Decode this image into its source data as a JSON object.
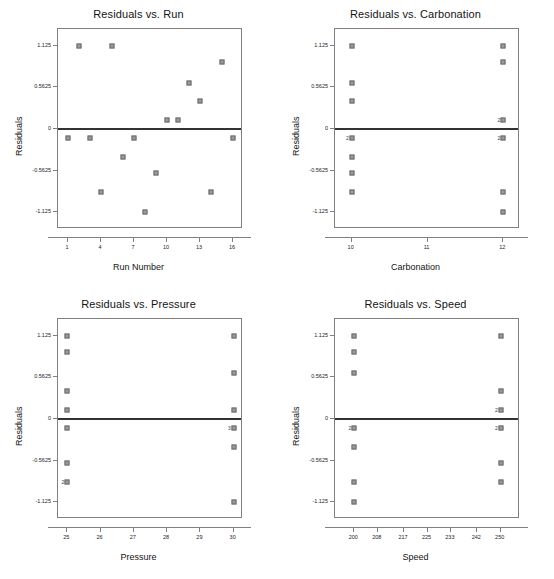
{
  "figure": {
    "marker_color": "#9a9a9a",
    "marker_border": "#6b6b6b",
    "zero_line_color": "#333333",
    "frame_color": "#808080",
    "background": "#ffffff"
  },
  "chart_data": [
    {
      "type": "scatter",
      "title": "Residuals vs. Run",
      "xlabel": "Run Number",
      "ylabel": "Residuals",
      "xticks": [
        1,
        4,
        7,
        10,
        13,
        16
      ],
      "yticks": [
        1.125,
        0.5625,
        0,
        -0.5625,
        -1.125
      ],
      "ytick_labels": [
        "1.125",
        "0.5625",
        "0",
        "-0.5625",
        "-1.125"
      ],
      "xlim": [
        0.1,
        16.9
      ],
      "ylim": [
        -1.35,
        1.35
      ],
      "grid": false,
      "legend": "none",
      "reference_line": 0,
      "points": [
        {
          "x": 1,
          "y": -0.125
        },
        {
          "x": 2,
          "y": 1.125
        },
        {
          "x": 3,
          "y": -0.125
        },
        {
          "x": 4,
          "y": -0.85
        },
        {
          "x": 5,
          "y": 1.125
        },
        {
          "x": 6,
          "y": -0.375
        },
        {
          "x": 7,
          "y": -0.125
        },
        {
          "x": 8,
          "y": -1.125
        },
        {
          "x": 9,
          "y": -0.6
        },
        {
          "x": 10,
          "y": 0.125
        },
        {
          "x": 11,
          "y": 0.125
        },
        {
          "x": 12,
          "y": 0.625
        },
        {
          "x": 13,
          "y": 0.375
        },
        {
          "x": 14,
          "y": -0.85
        },
        {
          "x": 15,
          "y": 0.9
        },
        {
          "x": 16,
          "y": -0.125
        }
      ]
    },
    {
      "type": "scatter",
      "title": "Residuals vs. Carbonation",
      "xlabel": "Carbonation",
      "ylabel": "Residuals",
      "xticks": [
        10,
        11,
        12
      ],
      "yticks": [
        1.125,
        0.5625,
        0,
        -0.5625,
        -1.125
      ],
      "ytick_labels": [
        "1.125",
        "0.5625",
        "0",
        "-0.5625",
        "-1.125"
      ],
      "xlim": [
        9.78,
        12.22
      ],
      "ylim": [
        -1.35,
        1.35
      ],
      "grid": false,
      "legend": "none",
      "reference_line": 0,
      "points": [
        {
          "x": 10,
          "y": 1.125,
          "count": 1
        },
        {
          "x": 10,
          "y": 0.625,
          "count": 1
        },
        {
          "x": 10,
          "y": 0.375,
          "count": 1
        },
        {
          "x": 10,
          "y": -0.125,
          "count": 2,
          "label": "2"
        },
        {
          "x": 10,
          "y": -0.375,
          "count": 1
        },
        {
          "x": 10,
          "y": -0.6,
          "count": 1
        },
        {
          "x": 10,
          "y": -0.85,
          "count": 1
        },
        {
          "x": 12,
          "y": 1.125,
          "count": 1
        },
        {
          "x": 12,
          "y": 0.9,
          "count": 1
        },
        {
          "x": 12,
          "y": 0.125,
          "count": 2,
          "label": "2"
        },
        {
          "x": 12,
          "y": -0.125,
          "count": 2,
          "label": "2"
        },
        {
          "x": 12,
          "y": -0.85,
          "count": 1
        },
        {
          "x": 12,
          "y": -1.125,
          "count": 1
        }
      ]
    },
    {
      "type": "scatter",
      "title": "Residuals vs. Pressure",
      "xlabel": "Pressure",
      "ylabel": "Residuals",
      "xticks": [
        25,
        26,
        27,
        28,
        29,
        30
      ],
      "yticks": [
        1.125,
        0.5625,
        0,
        -0.5625,
        -1.125
      ],
      "ytick_labels": [
        "1.125",
        "0.5625",
        "0",
        "-0.5625",
        "-1.125"
      ],
      "xlim": [
        24.72,
        30.28
      ],
      "ylim": [
        -1.35,
        1.35
      ],
      "grid": false,
      "legend": "none",
      "reference_line": 0,
      "points": [
        {
          "x": 25,
          "y": 1.125,
          "count": 1
        },
        {
          "x": 25,
          "y": 0.9,
          "count": 1
        },
        {
          "x": 25,
          "y": 0.375,
          "count": 1
        },
        {
          "x": 25,
          "y": 0.125,
          "count": 1
        },
        {
          "x": 25,
          "y": -0.125,
          "count": 1
        },
        {
          "x": 25,
          "y": -0.6,
          "count": 1
        },
        {
          "x": 25,
          "y": -0.85,
          "count": 2,
          "label": "2"
        },
        {
          "x": 30,
          "y": 1.125,
          "count": 1
        },
        {
          "x": 30,
          "y": 0.625,
          "count": 1
        },
        {
          "x": 30,
          "y": 0.125,
          "count": 1
        },
        {
          "x": 30,
          "y": -0.125,
          "count": 3,
          "label": "3"
        },
        {
          "x": 30,
          "y": -0.375,
          "count": 1
        },
        {
          "x": 30,
          "y": -1.125,
          "count": 1
        }
      ]
    },
    {
      "type": "scatter",
      "title": "Residuals vs. Speed",
      "xlabel": "Speed",
      "ylabel": "Residuals",
      "xticks": [
        200,
        208,
        217,
        225,
        233,
        242,
        250
      ],
      "yticks": [
        1.125,
        0.5625,
        0,
        -0.5625,
        -1.125
      ],
      "ytick_labels": [
        "1.125",
        "0.5625",
        "0",
        "-0.5625",
        "-1.125"
      ],
      "xlim": [
        193.4,
        256.6
      ],
      "ylim": [
        -1.35,
        1.35
      ],
      "grid": false,
      "legend": "none",
      "reference_line": 0,
      "points": [
        {
          "x": 200,
          "y": 1.125,
          "count": 1
        },
        {
          "x": 200,
          "y": 0.9,
          "count": 1
        },
        {
          "x": 200,
          "y": 0.625,
          "count": 1
        },
        {
          "x": 200,
          "y": -0.125,
          "count": 2,
          "label": "2"
        },
        {
          "x": 200,
          "y": -0.375,
          "count": 1
        },
        {
          "x": 200,
          "y": -0.85,
          "count": 1
        },
        {
          "x": 200,
          "y": -1.125,
          "count": 1
        },
        {
          "x": 250,
          "y": 1.125,
          "count": 1
        },
        {
          "x": 250,
          "y": 0.375,
          "count": 1
        },
        {
          "x": 250,
          "y": 0.125,
          "count": 2,
          "label": "2"
        },
        {
          "x": 250,
          "y": -0.125,
          "count": 2,
          "label": "2"
        },
        {
          "x": 250,
          "y": -0.6,
          "count": 1
        },
        {
          "x": 250,
          "y": -0.85,
          "count": 1
        }
      ]
    }
  ]
}
